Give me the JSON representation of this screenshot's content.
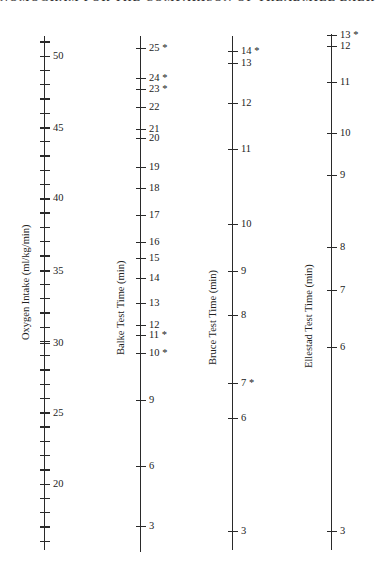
{
  "header": "NOMOGRAM FOR THE COMPARISON OF TREADMILL EXERCISE TECHNIQUES",
  "chart_data": {
    "type": "nomogram",
    "title": "Nomogram for the comparison of treadmill exercise techniques",
    "axes": [
      {
        "name": "oxygen",
        "label": "Oxygen Intake (ml/kg/min)",
        "x": 44,
        "y_top": 36,
        "y_bottom": 550,
        "minor_ticks": {
          "from": 16,
          "to": 51,
          "step": 1,
          "y_at_50": 56,
          "y_at_20": 484
        },
        "ticks": [
          {
            "value": "50",
            "y": 56
          },
          {
            "value": "45",
            "y": 128
          },
          {
            "value": "40",
            "y": 198
          },
          {
            "value": "35",
            "y": 271
          },
          {
            "value": "30",
            "y": 343
          },
          {
            "value": "25",
            "y": 413
          },
          {
            "value": "20",
            "y": 484
          }
        ]
      },
      {
        "name": "balke",
        "label": "Balke Test Time (min)",
        "x": 140,
        "y_top": 36,
        "y_bottom": 552,
        "ticks": [
          {
            "value": "25 *",
            "y": 48
          },
          {
            "value": "24 *",
            "y": 78
          },
          {
            "value": "23 *",
            "y": 89
          },
          {
            "value": "22",
            "y": 107
          },
          {
            "value": "21",
            "y": 129
          },
          {
            "value": "20",
            "y": 138
          },
          {
            "value": "19",
            "y": 167
          },
          {
            "value": "18",
            "y": 188
          },
          {
            "value": "17",
            "y": 215
          },
          {
            "value": "16",
            "y": 242
          },
          {
            "value": "15",
            "y": 258
          },
          {
            "value": "14",
            "y": 278
          },
          {
            "value": "13",
            "y": 303
          },
          {
            "value": "12",
            "y": 325
          },
          {
            "value": "11 *",
            "y": 335
          },
          {
            "value": "10 *",
            "y": 353
          },
          {
            "value": "9",
            "y": 400
          },
          {
            "value": "6",
            "y": 466
          },
          {
            "value": "3",
            "y": 526
          }
        ]
      },
      {
        "name": "bruce",
        "label": "Bruce Test Time (min)",
        "x": 232,
        "y_top": 36,
        "y_bottom": 550,
        "ticks": [
          {
            "value": "14 *",
            "y": 51
          },
          {
            "value": "13",
            "y": 63
          },
          {
            "value": "12",
            "y": 103
          },
          {
            "value": "11",
            "y": 149
          },
          {
            "value": "10",
            "y": 224
          },
          {
            "value": "9",
            "y": 271
          },
          {
            "value": "8",
            "y": 315
          },
          {
            "value": "7 *",
            "y": 383
          },
          {
            "value": "6",
            "y": 418
          },
          {
            "value": "3",
            "y": 531
          }
        ]
      },
      {
        "name": "ellestad",
        "label": "Ellestad Test Time (min)",
        "x": 331,
        "y_top": 34,
        "y_bottom": 550,
        "ticks": [
          {
            "value": "13 *",
            "y": 35
          },
          {
            "value": "12",
            "y": 46
          },
          {
            "value": "11",
            "y": 82
          },
          {
            "value": "10",
            "y": 133
          },
          {
            "value": "9",
            "y": 175
          },
          {
            "value": "8",
            "y": 247
          },
          {
            "value": "7",
            "y": 290
          },
          {
            "value": "6",
            "y": 347
          },
          {
            "value": "3",
            "y": 531
          }
        ]
      }
    ],
    "axis_title_positions": {
      "oxygen": {
        "x": 20,
        "y": 340
      },
      "balke": {
        "x": 115,
        "y": 355
      },
      "bruce": {
        "x": 207,
        "y": 365
      },
      "ellestad": {
        "x": 303,
        "y": 368
      }
    },
    "grid": false,
    "legend": null
  }
}
